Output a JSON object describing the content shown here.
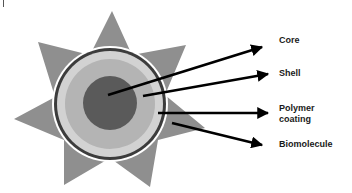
{
  "diagram": {
    "type": "nanoparticle-structure",
    "colors": {
      "star": "#8f8f8f",
      "outer_white_ring": "#ffffff",
      "dark_ring": "#3c3c3c",
      "polymer_coating": "#d2d2d2",
      "shell": "#b4b4b4",
      "core": "#5a5a5a",
      "arrow": "#000000"
    },
    "labels": [
      {
        "id": "core",
        "text": "Core"
      },
      {
        "id": "shell",
        "text": "Shell"
      },
      {
        "id": "polymer",
        "text_line1": "Polymer",
        "text_line2": "coating"
      },
      {
        "id": "biomolecule",
        "text": "Biomolecule"
      }
    ]
  }
}
